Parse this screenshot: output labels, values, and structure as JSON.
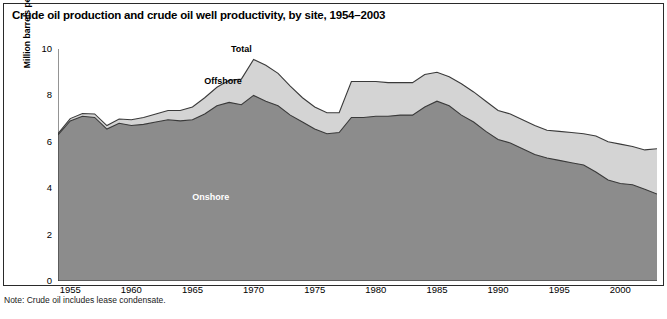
{
  "title": "Crude oil production and crude oil well productivity, by site, 1954–2003",
  "note": "Note: Crude oil includes lease condensate.",
  "axis": {
    "ylabel": "Million barrels per day (cumulative)",
    "yticks": [
      "0",
      "2",
      "4",
      "6",
      "8",
      "10"
    ],
    "xticks": [
      "1955",
      "1960",
      "1965",
      "1970",
      "1975",
      "1980",
      "1985",
      "1990",
      "1995",
      "2000"
    ]
  },
  "series_labels": {
    "total": "Total",
    "offshore": "Offshore",
    "onshore": "Onshore"
  },
  "colors": {
    "onshore_fill": "#8c8c8c",
    "offshore_fill": "#d4d4d4",
    "outline": "#3a3a3a",
    "frame": "#2a2a2a",
    "background": "#ffffff"
  },
  "chart_data": {
    "type": "area",
    "stacked": true,
    "title": "Crude oil production and crude oil well productivity, by site, 1954–2003",
    "xlabel": "",
    "ylabel": "Million barrels per day (cumulative)",
    "xlim": [
      1954,
      2003
    ],
    "ylim": [
      0,
      10
    ],
    "grid": false,
    "legend": "inline-annotations",
    "x": [
      1954,
      1955,
      1956,
      1957,
      1958,
      1959,
      1960,
      1961,
      1962,
      1963,
      1964,
      1965,
      1966,
      1967,
      1968,
      1969,
      1970,
      1971,
      1972,
      1973,
      1974,
      1975,
      1976,
      1977,
      1978,
      1979,
      1980,
      1981,
      1982,
      1983,
      1984,
      1985,
      1986,
      1987,
      1988,
      1989,
      1990,
      1991,
      1992,
      1993,
      1994,
      1995,
      1996,
      1997,
      1998,
      1999,
      2000,
      2001,
      2002,
      2003
    ],
    "series": [
      {
        "name": "Onshore",
        "values": [
          6.3,
          6.9,
          7.1,
          7.05,
          6.55,
          6.8,
          6.7,
          6.75,
          6.85,
          6.95,
          6.9,
          6.95,
          7.2,
          7.55,
          7.7,
          7.6,
          8.0,
          7.75,
          7.55,
          7.15,
          6.85,
          6.55,
          6.35,
          6.4,
          7.05,
          7.05,
          7.1,
          7.1,
          7.15,
          7.15,
          7.5,
          7.75,
          7.55,
          7.15,
          6.85,
          6.45,
          6.1,
          5.95,
          5.7,
          5.45,
          5.3,
          5.2,
          5.1,
          5.0,
          4.7,
          4.35,
          4.2,
          4.15,
          3.95,
          3.75
        ]
      },
      {
        "name": "Offshore",
        "values": [
          0.05,
          0.1,
          0.12,
          0.15,
          0.15,
          0.18,
          0.25,
          0.3,
          0.35,
          0.4,
          0.45,
          0.55,
          0.7,
          0.8,
          0.95,
          1.1,
          1.55,
          1.55,
          1.4,
          1.25,
          1.05,
          0.95,
          0.9,
          0.85,
          1.55,
          1.55,
          1.5,
          1.45,
          1.4,
          1.4,
          1.4,
          1.25,
          1.25,
          1.35,
          1.3,
          1.3,
          1.25,
          1.25,
          1.25,
          1.25,
          1.2,
          1.25,
          1.3,
          1.35,
          1.55,
          1.65,
          1.7,
          1.65,
          1.7,
          1.95
        ]
      }
    ],
    "totals": [
      6.35,
      7.0,
      7.22,
      7.2,
      6.7,
      6.98,
      6.95,
      7.05,
      7.2,
      7.35,
      7.35,
      7.5,
      7.9,
      8.35,
      8.65,
      8.7,
      9.55,
      9.3,
      8.95,
      8.4,
      7.9,
      7.5,
      7.25,
      7.25,
      8.6,
      8.6,
      8.6,
      8.55,
      8.55,
      8.55,
      8.9,
      9.0,
      8.8,
      8.5,
      8.15,
      7.75,
      7.35,
      7.2,
      6.95,
      6.7,
      6.5,
      6.45,
      6.4,
      6.35,
      6.25,
      6.0,
      5.9,
      5.8,
      5.65,
      5.7
    ],
    "annotations": [
      {
        "text": "Total",
        "x": 1969,
        "y": 10.0
      },
      {
        "text": "Offshore",
        "x": 1967.5,
        "y": 8.6
      },
      {
        "text": "Onshore",
        "x": 1966.5,
        "y": 3.6
      }
    ]
  }
}
